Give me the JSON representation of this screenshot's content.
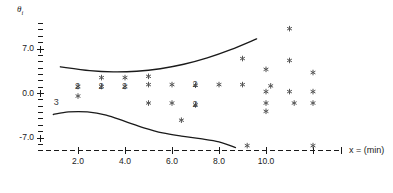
{
  "chart_data": {
    "type": "scatter",
    "title": "",
    "subtitle": "",
    "xlabel": "x = (min)",
    "ylabel": "θi",
    "ylabel_base": "θ",
    "ylabel_sub": "i",
    "xlim": [
      0.4,
      12.6
    ],
    "ylim": [
      -9.4,
      11.5
    ],
    "xticks": [
      2.0,
      4.0,
      6.0,
      8.0,
      10.0
    ],
    "xtick_labels": [
      "2.0",
      "4.0",
      "6.0",
      "8.0",
      "10.0"
    ],
    "yticks": [
      7.0,
      0.0,
      -7.0
    ],
    "ytick_labels": [
      "7.0",
      "0.0",
      "-7.0"
    ],
    "yminor_step": 1.0,
    "grid": false,
    "legend": null,
    "axis_style": "dashed-x-axis-with-plus-ticks",
    "marker": "asterisk",
    "marker_color": "#555555",
    "curve_color": "#1a1a1a",
    "series": [
      {
        "name": "scatter points",
        "points": [
          {
            "x": 2.0,
            "y": 1.1,
            "count": 2
          },
          {
            "x": 2.0,
            "y": -0.4,
            "count": 1
          },
          {
            "x": 3.0,
            "y": 2.5,
            "count": 1
          },
          {
            "x": 3.0,
            "y": 1.1,
            "count": 2
          },
          {
            "x": 4.0,
            "y": 2.5,
            "count": 1
          },
          {
            "x": 4.0,
            "y": 1.1,
            "count": 2
          },
          {
            "x": 5.0,
            "y": 2.7,
            "count": 1
          },
          {
            "x": 5.0,
            "y": 1.4,
            "count": 1
          },
          {
            "x": 5.0,
            "y": -1.5,
            "count": 1
          },
          {
            "x": 6.0,
            "y": 1.4,
            "count": 1
          },
          {
            "x": 6.0,
            "y": -1.5,
            "count": 1
          },
          {
            "x": 6.4,
            "y": -4.2,
            "count": 1
          },
          {
            "x": 7.0,
            "y": 1.3,
            "count": 2
          },
          {
            "x": 7.0,
            "y": -1.8,
            "count": 2
          },
          {
            "x": 8.0,
            "y": 1.4,
            "count": 1
          },
          {
            "x": 9.0,
            "y": 1.4,
            "count": 1
          },
          {
            "x": 9.0,
            "y": 5.5,
            "count": 1
          },
          {
            "x": 9.2,
            "y": -8.2,
            "count": 1
          },
          {
            "x": 10.0,
            "y": 3.8,
            "count": 1
          },
          {
            "x": 10.0,
            "y": 0.3,
            "count": 1
          },
          {
            "x": 10.0,
            "y": -1.5,
            "count": 1
          },
          {
            "x": 10.0,
            "y": -2.8,
            "count": 1
          },
          {
            "x": 10.2,
            "y": 1.2,
            "count": 1
          },
          {
            "x": 11.0,
            "y": 10.2,
            "count": 1
          },
          {
            "x": 11.0,
            "y": 5.2,
            "count": 1
          },
          {
            "x": 11.0,
            "y": 0.3,
            "count": 1
          },
          {
            "x": 11.2,
            "y": -1.5,
            "count": 1
          },
          {
            "x": 12.0,
            "y": 3.3,
            "count": 1
          },
          {
            "x": 12.0,
            "y": 0.3,
            "count": 1
          },
          {
            "x": 12.0,
            "y": -1.5,
            "count": 1
          },
          {
            "x": 12.0,
            "y": -8.2,
            "count": 1
          }
        ]
      },
      {
        "name": "upper fitted curve",
        "type": "line",
        "points": [
          {
            "x": 1.25,
            "y": 4.2
          },
          {
            "x": 2.5,
            "y": 3.6
          },
          {
            "x": 3.5,
            "y": 3.4
          },
          {
            "x": 4.5,
            "y": 3.5
          },
          {
            "x": 5.5,
            "y": 3.9
          },
          {
            "x": 6.5,
            "y": 4.6
          },
          {
            "x": 7.5,
            "y": 5.6
          },
          {
            "x": 8.5,
            "y": 6.9
          },
          {
            "x": 9.6,
            "y": 8.6
          }
        ]
      },
      {
        "name": "lower fitted curve",
        "type": "line",
        "points": [
          {
            "x": 0.95,
            "y": -3.3
          },
          {
            "x": 1.6,
            "y": -2.9
          },
          {
            "x": 2.4,
            "y": -2.9
          },
          {
            "x": 3.2,
            "y": -3.4
          },
          {
            "x": 4.0,
            "y": -4.4
          },
          {
            "x": 4.8,
            "y": -5.4
          },
          {
            "x": 5.6,
            "y": -6.2
          },
          {
            "x": 6.4,
            "y": -6.7
          },
          {
            "x": 7.2,
            "y": -7.1
          },
          {
            "x": 8.0,
            "y": -7.6
          },
          {
            "x": 8.7,
            "y": -8.5
          }
        ]
      }
    ],
    "overlap_annotations": [
      {
        "label": "2",
        "x": 2.0,
        "y": 1.1
      },
      {
        "label": "2",
        "x": 3.0,
        "y": 1.1
      },
      {
        "label": "2",
        "x": 4.0,
        "y": 1.1
      },
      {
        "label": "2",
        "x": 7.0,
        "y": 1.3
      },
      {
        "label": "2",
        "x": 7.0,
        "y": -1.8
      },
      {
        "label": "3",
        "x": 1.1,
        "y": -1.5
      }
    ]
  }
}
